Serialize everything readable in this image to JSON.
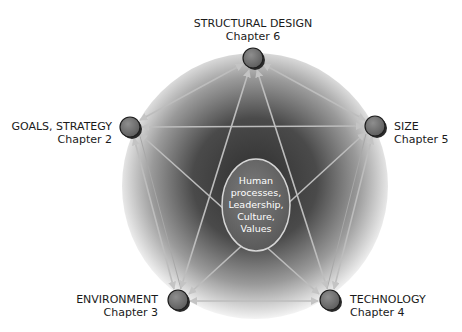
{
  "diagram": {
    "type": "pentagon-network",
    "center": {
      "lines": [
        "Human",
        "processes,",
        "Leadership,",
        "Culture,",
        "Values"
      ]
    },
    "nodes": [
      {
        "id": "structural-design",
        "title": "STRUCTURAL DESIGN",
        "chapter": "Chapter 6",
        "x": 253,
        "y": 58
      },
      {
        "id": "size",
        "title": "SIZE",
        "chapter": "Chapter 5",
        "x": 375,
        "y": 126
      },
      {
        "id": "technology",
        "title": "TECHNOLOGY",
        "chapter": "Chapter 4",
        "x": 330,
        "y": 300
      },
      {
        "id": "environment",
        "title": "ENVIRONMENT",
        "chapter": "Chapter 3",
        "x": 178,
        "y": 300
      },
      {
        "id": "goals-strategy",
        "title": "GOALS, STRATEGY",
        "chapter": "Chapter 2",
        "x": 130,
        "y": 127
      }
    ],
    "edges": "all pairs of nodes connected by bidirectional arrows",
    "colors": {
      "sphere_dark": "#3a3a3a",
      "sphere_light": "#f2f2f2",
      "node_fill": "#7a7a7a",
      "node_border": "#1e1e1e",
      "arrow": "#b9b9b9",
      "core_fill": "#6e6e6e",
      "core_border": "#d8d8d8"
    }
  }
}
